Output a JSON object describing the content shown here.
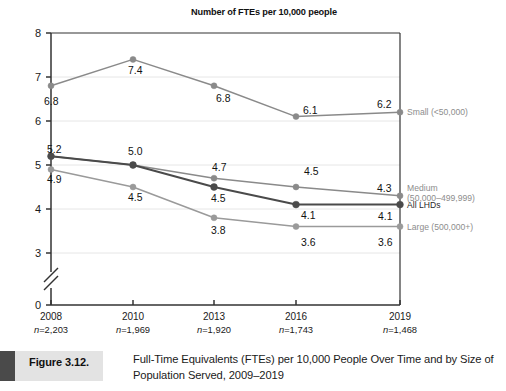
{
  "chart_data": {
    "type": "line",
    "title": "Number of FTEs per 10,000 people",
    "xlabel": "",
    "ylabel": "",
    "ylim": [
      0,
      8
    ],
    "yticks": [
      "8",
      "7",
      "6",
      "5",
      "4",
      "3",
      "0"
    ],
    "axis_break": true,
    "grid": true,
    "legend_position": "right",
    "categories": [
      "2008",
      "2010",
      "2013",
      "2016",
      "2019"
    ],
    "sample_sizes": [
      "n=2,203",
      "n=1,969",
      "n=1,920",
      "n=1,743",
      "n=1,468"
    ],
    "series": [
      {
        "name": "Small (<50,000)",
        "legend_line1": "Small (<50,000)",
        "legend_line2": "",
        "color": "#8a8a8a",
        "values": [
          6.8,
          7.4,
          6.8,
          6.1,
          6.2
        ],
        "labels": [
          "6.8",
          "7.4",
          "6.8",
          "6.1",
          "6.2"
        ]
      },
      {
        "name": "Medium (50,000-499,999)",
        "legend_line1": "Medium",
        "legend_line2": "(50,000–499,999)",
        "color": "#8a8a8a",
        "values": [
          5.2,
          5.0,
          4.7,
          4.5,
          4.3
        ],
        "labels": [
          "5.2",
          "5.0",
          "4.7",
          "4.5",
          "4.3"
        ]
      },
      {
        "name": "All LHDs",
        "legend_line1": "All LHDs",
        "legend_line2": "",
        "color": "#4a4a4a",
        "values": [
          5.2,
          5.0,
          4.5,
          4.1,
          4.1
        ],
        "labels": [
          "5.2",
          "5.0",
          "4.5",
          "4.1",
          "4.1"
        ]
      },
      {
        "name": "Large (500,000+)",
        "legend_line1": "Large (500,000+)",
        "legend_line2": "",
        "color": "#9a9a9a",
        "values": [
          4.9,
          4.5,
          3.8,
          3.6,
          3.6
        ],
        "labels": [
          "4.9",
          "4.5",
          "3.8",
          "3.6",
          "3.6"
        ]
      }
    ],
    "point_labels": [
      {
        "text": "6.8",
        "x": 44,
        "y": 97,
        "series": "Small (<50,000)"
      },
      {
        "text": "7.4",
        "x": 128,
        "y": 66,
        "series": "Small (<50,000)"
      },
      {
        "text": "6.8",
        "x": 216,
        "y": 94,
        "series": "Small (<50,000)"
      },
      {
        "text": "6.1",
        "x": 303,
        "y": 106,
        "series": "Small (<50,000)"
      },
      {
        "text": "6.2",
        "x": 377,
        "y": 100,
        "series": "Small (<50,000)"
      },
      {
        "text": "5.2",
        "x": 47,
        "y": 145,
        "series": "All LHDs"
      },
      {
        "text": "5.0",
        "x": 128,
        "y": 147,
        "series": "All LHDs"
      },
      {
        "text": "4.7",
        "x": 212,
        "y": 163,
        "series": "Medium (50,000-499,999)"
      },
      {
        "text": "4.5",
        "x": 304,
        "y": 167,
        "series": "Medium (50,000-499,999)"
      },
      {
        "text": "4.3",
        "x": 377,
        "y": 184,
        "series": "Medium (50,000-499,999)"
      },
      {
        "text": "4.9",
        "x": 47,
        "y": 175,
        "series": "Large (500,000+)"
      },
      {
        "text": "4.5",
        "x": 128,
        "y": 193,
        "series": "Large (500,000+)"
      },
      {
        "text": "4.5",
        "x": 211,
        "y": 194,
        "series": "All LHDs"
      },
      {
        "text": "4.1",
        "x": 301,
        "y": 211,
        "series": "All LHDs"
      },
      {
        "text": "4.1",
        "x": 378,
        "y": 212,
        "series": "All LHDs"
      },
      {
        "text": "3.8",
        "x": 211,
        "y": 226,
        "series": "Large (500,000+)"
      },
      {
        "text": "3.6",
        "x": 301,
        "y": 238,
        "series": "Large (500,000+)"
      },
      {
        "text": "3.6",
        "x": 378,
        "y": 238,
        "series": "Large (500,000+)"
      }
    ]
  },
  "caption": {
    "figure_number": "Figure 3.12.",
    "text": "Full-Time Equivalents (FTEs) per 10,000 People Over Time and by Size of Population Served, 2009–2019"
  },
  "colors": {
    "dark_series": "#4a4a4a",
    "grey_series": "#8a8a8a",
    "axis": "#333333",
    "gridline": "#e6e6e6",
    "caption_block": "#4a4a4a",
    "caption_band": "#e3e3e3"
  }
}
